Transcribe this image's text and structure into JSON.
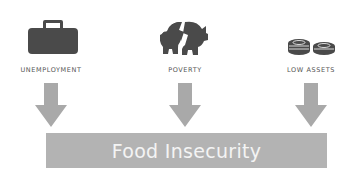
{
  "causes": [
    {
      "label": "UNEMPLOYMENT",
      "icon": "briefcase-icon"
    },
    {
      "label": "POVERTY",
      "icon": "broken-piggy-bank-icon"
    },
    {
      "label": "LOW ASSETS",
      "icon": "coins-icon"
    }
  ],
  "outcome": {
    "label": "Food Insecurity"
  },
  "colors": {
    "icon": "#4a4a4a",
    "arrow": "#a9a9a9",
    "box": "#b3b3b3",
    "box_text": "#f4f4f4",
    "label": "#555555"
  }
}
